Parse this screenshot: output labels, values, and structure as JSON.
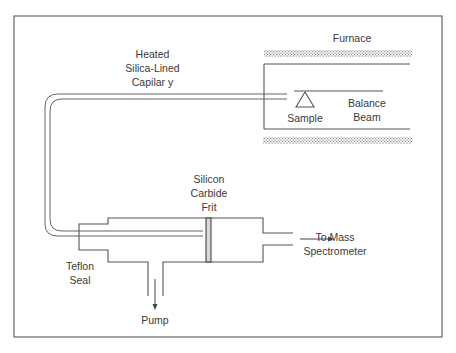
{
  "diagram": {
    "type": "apparatus-schematic",
    "labels": {
      "furnace": "Furnace",
      "capillary": [
        "Heated",
        "Silica-Lined",
        "Capilar y"
      ],
      "sample": "Sample",
      "balance_beam": [
        "Balance",
        "Beam"
      ],
      "frit": [
        "Silicon",
        "Carbide",
        "Frit"
      ],
      "mass_spec": [
        "To Mass",
        "Spectrometer"
      ],
      "seal": [
        "Teflon",
        "Seal"
      ],
      "pump": "Pump"
    },
    "colors": {
      "line": "#555555",
      "text": "#3a3a3a",
      "frit_fill": "#d8d8d8",
      "hatch": "#9a9a9a"
    }
  }
}
